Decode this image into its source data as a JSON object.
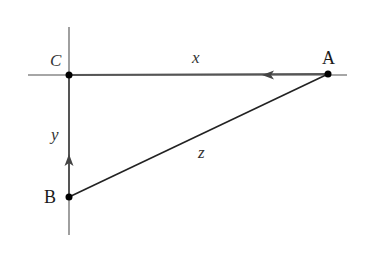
{
  "diagram": {
    "type": "right-triangle-geometry",
    "colors": {
      "axis": "#888888",
      "segment": "#555555",
      "hypotenuse": "#222222",
      "point": "#000000",
      "background": "#ffffff"
    },
    "axes": {
      "horizontal": {
        "x1": 28,
        "y1": 75,
        "x2": 347,
        "y2": 75
      },
      "vertical": {
        "x1": 69,
        "y1": 27,
        "x2": 69,
        "y2": 235
      }
    },
    "points": [
      {
        "id": "C",
        "label": "C",
        "x": 69,
        "y": 75,
        "italic": true,
        "label_x": 50,
        "label_y": 66
      },
      {
        "id": "A",
        "label": "A",
        "x": 328,
        "y": 74,
        "italic": false,
        "label_x": 322,
        "label_y": 64
      },
      {
        "id": "B",
        "label": "B",
        "x": 69,
        "y": 197,
        "italic": false,
        "label_x": 44,
        "label_y": 203
      }
    ],
    "segments": [
      {
        "id": "x",
        "label": "x",
        "from": "A",
        "to": "C",
        "label_x": 192,
        "label_y": 63,
        "arrow": {
          "x": 268,
          "y": 75,
          "direction": "left"
        }
      },
      {
        "id": "y",
        "label": "y",
        "from": "B",
        "to": "C",
        "label_x": 51,
        "label_y": 140,
        "arrow": {
          "x": 69,
          "y": 160,
          "direction": "up"
        }
      },
      {
        "id": "z",
        "label": "z",
        "from": "B",
        "to": "A",
        "label_x": 198,
        "label_y": 158
      }
    ]
  }
}
